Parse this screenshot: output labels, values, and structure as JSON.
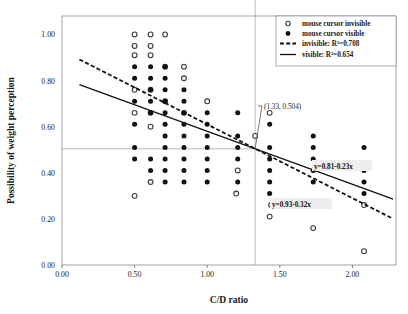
{
  "chart_data": {
    "type": "scatter",
    "title": "",
    "xlabel": "C/D ratio",
    "ylabel": "Possibility of weight perception",
    "xlim": [
      0.0,
      2.3
    ],
    "ylim": [
      0.0,
      1.08
    ],
    "xticks": [
      "0.00",
      "0.50",
      "1.00",
      "1.50",
      "2.00"
    ],
    "xtickvals": [
      0.0,
      0.5,
      1.0,
      1.5,
      2.0
    ],
    "yticks": [
      "0.00",
      "0.20",
      "0.40",
      "0.60",
      "0.80",
      "1.00"
    ],
    "ytickvals": [
      0.0,
      0.2,
      0.4,
      0.6,
      0.8,
      1.0
    ],
    "grid": false,
    "legend_position": "top-right",
    "legend": [
      {
        "key": "mouse-cursor-invisible",
        "label": "mouse cursor invisible",
        "marker": "open-circle"
      },
      {
        "key": "mouse-cursor-visible",
        "label": "mouse cursor visible",
        "marker": "filled-circle"
      },
      {
        "key": "invisible-fit",
        "label": "invisible: R²=0.708",
        "marker": "dashed-line"
      },
      {
        "key": "visible-fit",
        "label": "visible: R²=0.654",
        "marker": "solid-line"
      }
    ],
    "series": [
      {
        "name": "mouse cursor invisible",
        "marker": "open-circle",
        "points": [
          [
            0.5,
            1.0
          ],
          [
            0.5,
            0.95
          ],
          [
            0.5,
            0.91
          ],
          [
            0.5,
            0.76
          ],
          [
            0.5,
            0.66
          ],
          [
            0.5,
            0.3
          ],
          [
            0.61,
            1.0
          ],
          [
            0.61,
            0.95
          ],
          [
            0.61,
            0.91
          ],
          [
            0.61,
            0.76
          ],
          [
            0.61,
            0.66
          ],
          [
            0.61,
            0.6
          ],
          [
            0.61,
            0.36
          ],
          [
            0.71,
            1.0
          ],
          [
            0.71,
            0.86
          ],
          [
            0.71,
            0.71
          ],
          [
            0.84,
            0.86
          ],
          [
            0.84,
            0.81
          ],
          [
            0.84,
            0.66
          ],
          [
            1.0,
            0.71
          ],
          [
            1.2,
            0.31
          ],
          [
            1.21,
            0.41
          ],
          [
            1.33,
            0.56
          ],
          [
            1.43,
            0.66
          ],
          [
            1.43,
            0.21
          ],
          [
            1.44,
            0.26
          ],
          [
            1.73,
            0.16
          ],
          [
            2.08,
            0.26
          ],
          [
            2.08,
            0.06
          ]
        ]
      },
      {
        "name": "mouse cursor visible",
        "marker": "filled-circle",
        "points": [
          [
            0.5,
            0.86
          ],
          [
            0.5,
            0.81
          ],
          [
            0.5,
            0.71
          ],
          [
            0.5,
            0.61
          ],
          [
            0.5,
            0.51
          ],
          [
            0.5,
            0.46
          ],
          [
            0.61,
            0.86
          ],
          [
            0.61,
            0.81
          ],
          [
            0.61,
            0.76
          ],
          [
            0.61,
            0.71
          ],
          [
            0.61,
            0.66
          ],
          [
            0.61,
            0.46
          ],
          [
            0.61,
            0.41
          ],
          [
            0.71,
            0.86
          ],
          [
            0.71,
            0.81
          ],
          [
            0.71,
            0.76
          ],
          [
            0.71,
            0.71
          ],
          [
            0.71,
            0.66
          ],
          [
            0.71,
            0.61
          ],
          [
            0.71,
            0.56
          ],
          [
            0.71,
            0.51
          ],
          [
            0.71,
            0.46
          ],
          [
            0.71,
            0.41
          ],
          [
            0.71,
            0.36
          ],
          [
            0.84,
            0.76
          ],
          [
            0.84,
            0.71
          ],
          [
            0.84,
            0.66
          ],
          [
            0.84,
            0.61
          ],
          [
            0.84,
            0.56
          ],
          [
            0.84,
            0.51
          ],
          [
            0.84,
            0.46
          ],
          [
            0.84,
            0.41
          ],
          [
            0.84,
            0.36
          ],
          [
            1.0,
            0.66
          ],
          [
            1.0,
            0.61
          ],
          [
            1.0,
            0.56
          ],
          [
            1.0,
            0.51
          ],
          [
            1.0,
            0.46
          ],
          [
            1.0,
            0.41
          ],
          [
            1.0,
            0.36
          ],
          [
            1.21,
            0.66
          ],
          [
            1.21,
            0.56
          ],
          [
            1.21,
            0.51
          ],
          [
            1.21,
            0.46
          ],
          [
            1.21,
            0.36
          ],
          [
            1.43,
            0.61
          ],
          [
            1.43,
            0.51
          ],
          [
            1.43,
            0.46
          ],
          [
            1.43,
            0.41
          ],
          [
            1.43,
            0.36
          ],
          [
            1.43,
            0.31
          ],
          [
            1.73,
            0.56
          ],
          [
            1.73,
            0.51
          ],
          [
            1.73,
            0.46
          ],
          [
            1.73,
            0.41
          ],
          [
            1.73,
            0.36
          ],
          [
            2.08,
            0.51
          ],
          [
            2.08,
            0.41
          ],
          [
            2.08,
            0.36
          ],
          [
            2.08,
            0.31
          ]
        ]
      }
    ],
    "fits": [
      {
        "key": "invisible-fit",
        "style": "dashed",
        "slope": -0.32,
        "intercept": 0.93,
        "label": "y=0.93-0.32x",
        "r2": 0.708
      },
      {
        "key": "visible-fit",
        "style": "solid",
        "slope": -0.23,
        "intercept": 0.81,
        "label": "y=0.81-0.23x",
        "r2": 0.654
      }
    ],
    "annotations": [
      {
        "key": "intersection",
        "text": "(1.33,  0.504)",
        "x": 1.33,
        "y": 0.504
      }
    ],
    "reference_lines": [
      {
        "key": "h-ref",
        "orientation": "horizontal",
        "value": 0.504
      },
      {
        "key": "v-ref",
        "orientation": "vertical",
        "value": 1.33
      }
    ]
  }
}
